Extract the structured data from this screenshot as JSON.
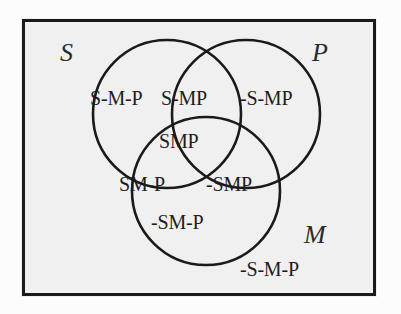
{
  "diagram": {
    "frame_label": "universe-of-discourse-rectangle",
    "colors": {
      "background_outer": "#fcfcfc",
      "background_inner": "#f0f0f0",
      "stroke": "#1a1a1a",
      "text": "#1d1d1d"
    },
    "sets": [
      {
        "id": "S",
        "label": "S",
        "name": "subject-term-circle"
      },
      {
        "id": "P",
        "label": "P",
        "name": "predicate-term-circle"
      },
      {
        "id": "M",
        "label": "M",
        "name": "middle-term-circle"
      }
    ],
    "regions": [
      {
        "id": "s-only",
        "label": "S-M-P"
      },
      {
        "id": "sm-not-p",
        "label": "S-MP"
      },
      {
        "id": "p-only",
        "label": "-S-MP"
      },
      {
        "id": "smp",
        "label": "SMP"
      },
      {
        "id": "sm-p",
        "label": "SM-P"
      },
      {
        "id": "mp-not-s",
        "label": "-SMP"
      },
      {
        "id": "m-only",
        "label": "-SM-P"
      },
      {
        "id": "none",
        "label": "-S-M-P"
      }
    ]
  }
}
